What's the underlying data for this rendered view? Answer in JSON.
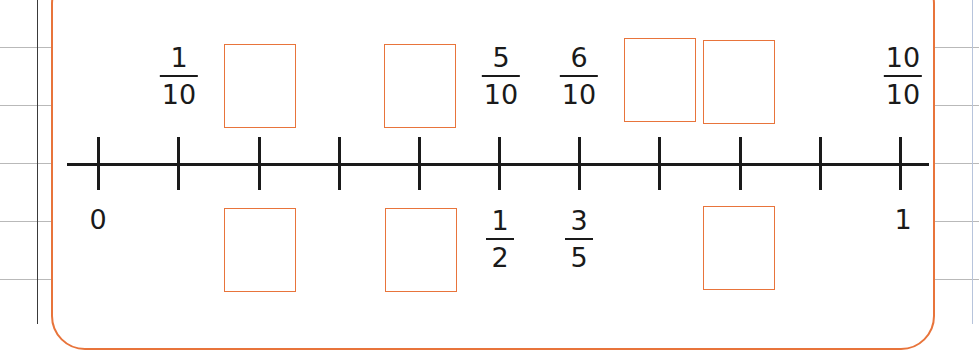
{
  "worksheet": {
    "number_line": {
      "start_label": "0",
      "end_label": "1",
      "divisions": 10,
      "tick_positions": [
        0,
        0.1,
        0.2,
        0.3,
        0.4,
        0.5,
        0.6,
        0.7,
        0.8,
        0.9,
        1.0
      ]
    },
    "top_labels": [
      {
        "position": 0.1,
        "numerator": "1",
        "denominator": "10"
      },
      {
        "position": 0.5,
        "numerator": "5",
        "denominator": "10"
      },
      {
        "position": 0.6,
        "numerator": "6",
        "denominator": "10"
      },
      {
        "position": 1.0,
        "numerator": "10",
        "denominator": "10"
      }
    ],
    "bottom_labels": [
      {
        "position": 0.5,
        "numerator": "1",
        "denominator": "2"
      },
      {
        "position": 0.6,
        "numerator": "3",
        "denominator": "5"
      }
    ],
    "top_answer_boxes": [
      {
        "position": 0.2,
        "value": ""
      },
      {
        "position": 0.4,
        "value": ""
      },
      {
        "position": 0.7,
        "value": ""
      },
      {
        "position": 0.8,
        "value": ""
      }
    ],
    "bottom_answer_boxes": [
      {
        "position": 0.2,
        "value": ""
      },
      {
        "position": 0.4,
        "value": ""
      },
      {
        "position": 0.8,
        "value": ""
      }
    ],
    "colors": {
      "panel_border": "#e8743b",
      "answer_box_border": "#e8743b",
      "axis": "#1a1a1a",
      "grid_line": "#b9b9b9"
    }
  }
}
